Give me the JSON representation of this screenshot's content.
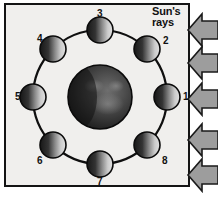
{
  "figure": {
    "background_color": "#ffffff",
    "panel_color": "#f0efed",
    "frame_color": "#141414"
  },
  "sun": {
    "label_line1": "Sun's",
    "label_line2": "rays",
    "arrow_color": "#9d9d9d",
    "arrow_outline": "#1a1a1a",
    "arrow_direction": "left",
    "arrow_count": 5,
    "arrows": [
      {
        "name": "sun-ray-arrow-1",
        "y": 30
      },
      {
        "name": "sun-ray-arrow-2",
        "y": 63
      },
      {
        "name": "sun-ray-arrow-3",
        "y": 99
      },
      {
        "name": "sun-ray-arrow-4",
        "y": 140
      },
      {
        "name": "sun-ray-arrow-5",
        "y": 175
      }
    ]
  },
  "earth": {
    "name": "earth",
    "cx": 100,
    "cy": 97,
    "r": 32,
    "lit_color": "#8e8e8e",
    "dark_color": "#1c1c1c",
    "outline": "#0d0d0d"
  },
  "orbit": {
    "name": "orbit-path",
    "cx": 100,
    "cy": 97,
    "r": 67,
    "stroke": "#0f0f0f",
    "stroke_width": 2.2
  },
  "moons": [
    {
      "id": 1,
      "label": "1",
      "angle_deg": 0,
      "cx": 167,
      "cy": 97,
      "r": 13,
      "label_x": 183,
      "label_y": 92,
      "lit_side": "right"
    },
    {
      "id": 2,
      "label": "2",
      "angle_deg": 45,
      "cx": 147,
      "cy": 49,
      "r": 13,
      "label_x": 163,
      "label_y": 36,
      "lit_side": "right"
    },
    {
      "id": 3,
      "label": "3",
      "angle_deg": 90,
      "cx": 100,
      "cy": 30,
      "r": 13,
      "label_x": 97,
      "label_y": 9,
      "lit_side": "right"
    },
    {
      "id": 4,
      "label": "4",
      "angle_deg": 135,
      "cx": 53,
      "cy": 49,
      "r": 13,
      "label_x": 37,
      "label_y": 34,
      "lit_side": "right"
    },
    {
      "id": 5,
      "label": "5",
      "angle_deg": 180,
      "cx": 33,
      "cy": 97,
      "r": 13,
      "label_x": 15,
      "label_y": 92,
      "lit_side": "right"
    },
    {
      "id": 6,
      "label": "6",
      "angle_deg": 225,
      "cx": 53,
      "cy": 145,
      "r": 13,
      "label_x": 37,
      "label_y": 156,
      "lit_side": "right"
    },
    {
      "id": 7,
      "label": "7",
      "angle_deg": 270,
      "cx": 100,
      "cy": 164,
      "r": 13,
      "label_x": 97,
      "label_y": 177,
      "lit_side": "right"
    },
    {
      "id": 8,
      "label": "8",
      "angle_deg": 315,
      "cx": 147,
      "cy": 145,
      "r": 13,
      "label_x": 162,
      "label_y": 156,
      "lit_side": "right"
    }
  ]
}
